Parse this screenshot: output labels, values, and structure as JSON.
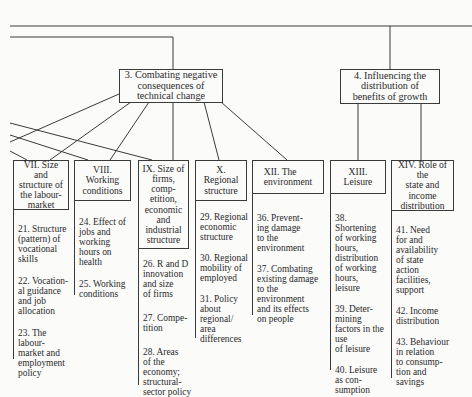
{
  "goals": [
    {
      "id": "3",
      "label": "3.  Combating negative\nconsequences of\ntechnical change"
    },
    {
      "id": "4",
      "label": "4.  Influencing the\ndistribution of\nbenefits of growth"
    }
  ],
  "areas": [
    {
      "id": "VII",
      "label": "VII.  Size and\nstructure of\nthe labour-\nmarket",
      "items": [
        "21.  Structure\n(pattern) of\nvocational\nskills",
        "22.  Vocation-\nal guidance\nand job\nallocation",
        "23. The labour-\nmarket and\nemployment\npolicy"
      ]
    },
    {
      "id": "VIII",
      "label": "VIII.  Working\nconditions",
      "items": [
        "24.  Effect of\njobs and\nworking\nhours on\nhealth",
        "25.  Working\nconditions"
      ]
    },
    {
      "id": "IX",
      "label": "IX.  Size of\nfirms, comp-\netition,\neconomic\nand\nindustrial\nstructure",
      "items": [
        "26.  R and D\ninnovation\nand size\nof firms",
        "27.  Compe-\ntition",
        "28.  Areas\nof the\neconomy;\nstructural-\nsector policy"
      ]
    },
    {
      "id": "X",
      "label": "X.  Regional\nstructure",
      "items": [
        "29.  Regional\neconomic\nstructure",
        "30.  Regional\nmobility of\nemployed",
        "31.  Policy\nabout\nregional/\narea\ndifferences"
      ]
    },
    {
      "id": "XII",
      "label": "XII.  The\n          environment",
      "items": [
        "36.  Prevent-\ning damage\nto the\nenvironment",
        "37.  Combating\nexisting damage\nto the\nenvironment\nand its effects\non people"
      ]
    },
    {
      "id": "XIII",
      "label": "XIII.  Leisure",
      "items": [
        "38.  Shortening\nof working\nhours,\ndistribution\nof working\nhours,\nleisure",
        "39.  Deter-\nmining\nfactors in the\nuse\nof leisure",
        "40.  Leisure\nas con-\nsumption"
      ]
    },
    {
      "id": "XIV",
      "label": "XIV.  Role of the\nstate and\nincome\ndistribution",
      "items": [
        "41.  Need\nfor and\navailability\nof state\naction\nfacilities,\nsupport",
        "42.  Income\ndistribution",
        "43.  Behaviour\nin relation\nto consump-\ntion and\nsavings"
      ]
    }
  ],
  "colors": {
    "line": "#3a3a3a",
    "background": "#fbfbfa",
    "text": "#2a2a2a"
  }
}
